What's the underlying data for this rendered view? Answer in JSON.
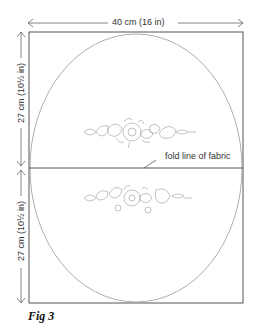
{
  "figure": {
    "caption": "Fig 3",
    "width_label": "40 cm (16 in)",
    "top_height_label": "27 cm (10½ in)",
    "bottom_height_label": "27 cm (10½ in)",
    "fold_label": "fold line of fabric"
  },
  "colors": {
    "line": "#555555",
    "sketch": "#9a9a9a",
    "text": "#333333"
  }
}
